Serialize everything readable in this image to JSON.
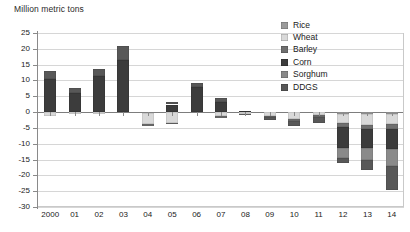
{
  "chart_data": {
    "type": "bar",
    "stacked": true,
    "title": "Million metric tons",
    "xlabel": "",
    "ylabel": "Million metric tons",
    "ylim": [
      -30,
      25
    ],
    "ytick_step": 5,
    "grid": true,
    "legend_position": "top-right",
    "categories": [
      "2000",
      "01",
      "02",
      "03",
      "04",
      "05",
      "06",
      "07",
      "08",
      "09",
      "10",
      "11",
      "12",
      "13",
      "14"
    ],
    "yticks": [
      "25",
      "20",
      "15",
      "10",
      "5",
      "0",
      "-5",
      "-10",
      "-15",
      "-20",
      "-25",
      "-30"
    ],
    "series": [
      {
        "name": "Rice",
        "color": "#9b9b9b",
        "values": [
          0,
          0,
          0,
          0,
          -0.4,
          0,
          0,
          0,
          0,
          0,
          0,
          0,
          -0.5,
          -0.5,
          -0.5
        ]
      },
      {
        "name": "Wheat",
        "color": "#d9d9d9",
        "values": [
          -1.3,
          -0.5,
          -0.6,
          0,
          -3.4,
          -3.4,
          0,
          -1.1,
          -0.6,
          -1.2,
          -2.2,
          -1.0,
          -3.0,
          -3.5,
          -3.2
        ]
      },
      {
        "name": "Barley",
        "color": "#6f6f6f",
        "values": [
          0,
          0,
          0,
          0,
          -0.6,
          -0.5,
          0,
          -0.8,
          -0.4,
          -0.5,
          -0.6,
          -0.5,
          -1.2,
          -1.4,
          -1.6
        ]
      },
      {
        "name": "Corn",
        "color": "#3c3c3c",
        "values": [
          10.4,
          6.0,
          11.4,
          16.6,
          0,
          2.4,
          7.8,
          3.1,
          0.5,
          0,
          0,
          0,
          -6.5,
          -6.0,
          -6.5
        ]
      },
      {
        "name": "Sorghum",
        "color": "#8a8a8a",
        "values": [
          0,
          0,
          0,
          0,
          0,
          0,
          0,
          0,
          0,
          0,
          0,
          0,
          -3.3,
          -3.8,
          -5.2
        ]
      },
      {
        "name": "DDGS",
        "color": "#585858",
        "values": [
          2.6,
          1.6,
          2.2,
          4.4,
          0,
          0.7,
          1.5,
          1.4,
          0,
          -0.8,
          -1.6,
          -1.9,
          -1.5,
          -3.0,
          -7.5
        ]
      }
    ],
    "totals_positive": [
      13.0,
      7.6,
      13.6,
      21.0,
      0,
      3.1,
      9.3,
      4.5,
      0.5,
      0,
      0,
      0,
      0,
      0,
      0
    ],
    "totals_negative": [
      -1.3,
      -0.5,
      -0.6,
      0,
      -4.4,
      -3.9,
      0,
      -1.9,
      -1.0,
      -2.5,
      -4.4,
      -3.4,
      -15.0,
      -18.2,
      -24.5
    ]
  },
  "legend": {
    "items": [
      {
        "label": "Rice"
      },
      {
        "label": "Wheat"
      },
      {
        "label": "Barley"
      },
      {
        "label": "Corn"
      },
      {
        "label": "Sorghum"
      },
      {
        "label": "DDGS"
      }
    ]
  }
}
